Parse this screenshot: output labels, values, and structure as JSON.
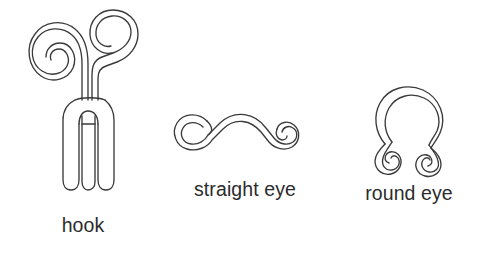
{
  "page": {
    "background_color": "#ffffff",
    "line_color": "#3a3a3c",
    "text_color": "#2b2b2d",
    "width": 485,
    "height": 276
  },
  "figures": [
    {
      "id": "hook",
      "caption": "hook",
      "icon_name": "hook-wire-diagram",
      "description": "Wire hook with two spiral loops at top and long U-bend shank"
    },
    {
      "id": "straight-eye",
      "caption": "straight eye",
      "icon_name": "straight-eye-wire-diagram",
      "description": "Straight wire bar with a spiral curl at each end"
    },
    {
      "id": "round-eye",
      "caption": "round eye",
      "icon_name": "round-eye-wire-diagram",
      "description": "Round wire loop with two spiral curls at the base"
    }
  ]
}
